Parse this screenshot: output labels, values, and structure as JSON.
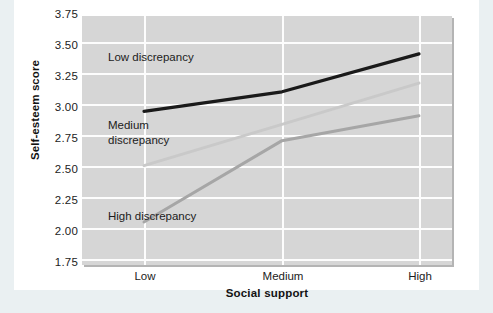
{
  "chart_data": {
    "type": "line",
    "title": "",
    "xlabel": "Social support",
    "ylabel": "Self-esteem score",
    "categories": [
      "Low",
      "Medium",
      "High"
    ],
    "ylim": [
      1.75,
      3.75
    ],
    "yticks": [
      "1.75",
      "2.00",
      "2.25",
      "2.50",
      "2.75",
      "3.00",
      "3.25",
      "3.50",
      "3.75"
    ],
    "ytick_values": [
      1.75,
      2.0,
      2.25,
      2.5,
      2.75,
      3.0,
      3.25,
      3.5,
      3.75
    ],
    "grid": "horizontal-and-vertical-white-on-gray",
    "legend": "inline-labels",
    "series": [
      {
        "name": "Low discrepancy",
        "label": "Low discrepancy",
        "color": "#1a1a1a",
        "values": [
          3.12,
          3.3,
          3.65
        ]
      },
      {
        "name": "Medium discrepancy",
        "label": "Medium\ndiscrepancy",
        "color": "#c9c9c9",
        "values": [
          2.62,
          3.0,
          3.38
        ]
      },
      {
        "name": "High discrepancy",
        "label": "High discrepancy",
        "color": "#a6a6a6",
        "values": [
          2.1,
          2.85,
          3.08
        ]
      }
    ]
  },
  "colors": {
    "page_background": "#eaf0f2",
    "card_background": "#ffffff",
    "plot_background": "#d6d6d6",
    "gridline": "#fdfdfd",
    "text": "#1c1c1c"
  }
}
